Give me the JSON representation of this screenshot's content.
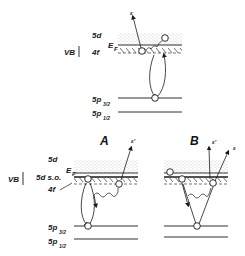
{
  "top_panel": {
    "labels": {
      "vb": "VB",
      "d5": "5d",
      "f4": "4f",
      "ef": "E",
      "ef_sub": "F",
      "p32": "5p",
      "p32_sub": "3/2",
      "p12": "5p",
      "p12_sub": "1/2",
      "electron": "ε"
    }
  },
  "bottom_panels": {
    "vb": "VB",
    "d5": "5d",
    "d5so": "5d s.o.",
    "f4": "4f",
    "ef": "E",
    "ef_sub": "F",
    "p32": "5p",
    "p32_sub": "3/2",
    "p12": "5p",
    "p12_sub": "1/2",
    "panel_a": {
      "title": "A",
      "electron": "ε'"
    },
    "panel_b": {
      "title": "B",
      "electron1": "ε'",
      "electron2": "ε"
    }
  },
  "colors": {
    "ink": "#1a1a1a",
    "stipple": "#9a9a9a",
    "background": "#ffffff"
  }
}
